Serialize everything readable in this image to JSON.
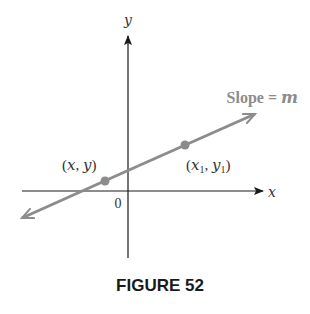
{
  "figure": {
    "caption": "FIGURE 52",
    "axes": {
      "x_label": "x",
      "y_label": "y",
      "origin_label": "0"
    },
    "line": {
      "label_prefix": "Slope = ",
      "label_var": "m",
      "color": "#8c8c8c"
    },
    "points": [
      {
        "label_open": "(x, y)",
        "x": 105,
        "y": 181
      },
      {
        "label_x": "x",
        "label_y": "y",
        "subscript": "1",
        "x": 185,
        "y": 145
      }
    ],
    "colors": {
      "axis": "#1a1a1a",
      "line": "#8c8c8c",
      "text": "#333333",
      "caption": "#1a1a1a"
    }
  }
}
